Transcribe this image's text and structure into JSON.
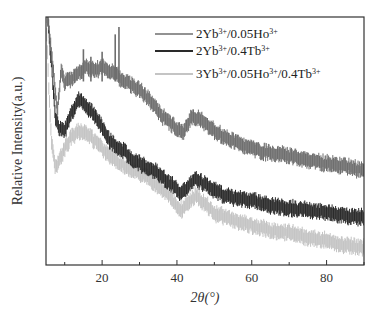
{
  "chart_data": {
    "type": "line",
    "title": "",
    "xlabel": "2θ(°)",
    "ylabel": "Relative Intensity(a.u.)",
    "xlim": [
      5,
      90
    ],
    "ylim": [
      0,
      1
    ],
    "x_ticks": [
      20,
      40,
      60,
      80
    ],
    "y_ticks": [],
    "grid": false,
    "legend_position": "upper right",
    "series": [
      {
        "name": "2Yb3+/0.05Ho3+",
        "label_parts": [
          "2Yb",
          "3+",
          "/0.05Ho",
          "3+"
        ],
        "color": "#6e6e6e",
        "x": [
          5.5,
          6.5,
          8,
          9,
          10,
          12,
          14,
          16,
          18,
          20,
          22,
          24,
          25,
          27,
          30,
          33,
          36,
          40,
          42,
          44,
          46,
          50,
          55,
          60,
          65,
          70,
          75,
          80,
          85,
          90
        ],
        "y": [
          0.99,
          0.85,
          0.62,
          0.78,
          0.74,
          0.75,
          0.78,
          0.8,
          0.78,
          0.8,
          0.78,
          0.77,
          0.75,
          0.73,
          0.71,
          0.66,
          0.6,
          0.55,
          0.54,
          0.6,
          0.59,
          0.54,
          0.5,
          0.47,
          0.45,
          0.44,
          0.42,
          0.41,
          0.4,
          0.38
        ]
      },
      {
        "name": "2Yb3+/0.4Tb3+",
        "label_parts": [
          "2Yb",
          "3+",
          "/0.4Tb",
          "3+"
        ],
        "color": "#2a2a2a",
        "x": [
          5.5,
          6.5,
          7.5,
          8.5,
          10,
          12,
          14,
          16,
          18,
          20,
          22,
          25,
          28,
          31,
          35,
          38,
          41,
          43,
          45,
          48,
          50,
          55,
          60,
          65,
          70,
          75,
          80,
          85,
          90
        ],
        "y": [
          0.99,
          0.8,
          0.6,
          0.55,
          0.54,
          0.62,
          0.67,
          0.64,
          0.6,
          0.56,
          0.5,
          0.47,
          0.43,
          0.4,
          0.37,
          0.33,
          0.29,
          0.32,
          0.35,
          0.32,
          0.3,
          0.27,
          0.26,
          0.24,
          0.23,
          0.22,
          0.21,
          0.2,
          0.19
        ]
      },
      {
        "name": "3Yb3+/0.05Ho3+/0.4Tb3+",
        "label_parts": [
          "3Yb",
          "3+",
          "/0.05Ho",
          "3+",
          "/0.4Tb",
          "3+"
        ],
        "color": "#c4c4c4",
        "x": [
          5,
          5.8,
          6.5,
          7.5,
          8.5,
          10,
          12,
          14,
          16,
          18,
          20,
          23,
          26,
          30,
          34,
          38,
          41,
          43,
          45,
          48,
          50,
          55,
          60,
          65,
          70,
          75,
          80,
          85,
          90
        ],
        "y": [
          0.99,
          0.7,
          0.5,
          0.39,
          0.42,
          0.47,
          0.52,
          0.54,
          0.53,
          0.5,
          0.47,
          0.43,
          0.4,
          0.37,
          0.33,
          0.28,
          0.22,
          0.25,
          0.28,
          0.24,
          0.21,
          0.18,
          0.16,
          0.14,
          0.13,
          0.11,
          0.1,
          0.08,
          0.07
        ]
      }
    ]
  },
  "plot_area": {
    "left": 46,
    "right": 364,
    "top": 17,
    "bottom": 265
  },
  "band_thickness": 11
}
